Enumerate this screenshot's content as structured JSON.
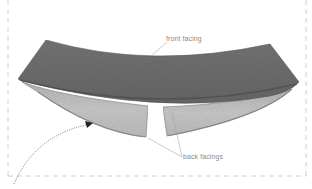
{
  "figure": {
    "labels": {
      "front_facing": "front facing",
      "back_facings": "back facings"
    },
    "colors": {
      "front_facing_fabric": "#6e6e6e",
      "back_facing_fabric": "#c4c4c4",
      "border_dash": "#c8c8c8",
      "label_text": "#8a8a8a",
      "leader_line": "#a8a8a8",
      "arrow": "#555555"
    },
    "icons": {
      "pointer_arrow": "dotted-curved-arrow"
    }
  }
}
